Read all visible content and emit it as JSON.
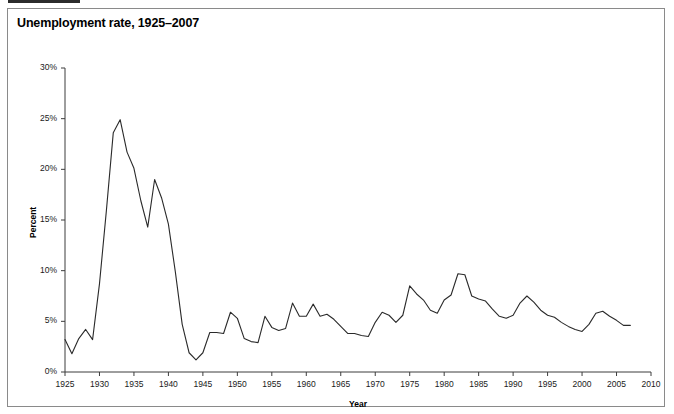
{
  "figure": {
    "title": "Unemployment rate, 1925–2007",
    "frame_border_color": "#8a8a8a",
    "background_color": "#ffffff",
    "line_color": "#2a2a2a"
  },
  "chart_data": {
    "type": "line",
    "title": "Unemployment rate, 1925–2007",
    "xlabel": "Year",
    "ylabel": "Percent",
    "xlim": [
      1925,
      2010
    ],
    "ylim": [
      0,
      30
    ],
    "xticks": [
      1925,
      1930,
      1935,
      1940,
      1945,
      1950,
      1955,
      1960,
      1965,
      1970,
      1975,
      1980,
      1985,
      1990,
      1995,
      2000,
      2005,
      2010
    ],
    "xtick_labels": [
      "1925",
      "1930",
      "1935",
      "1940",
      "1945",
      "1950",
      "1955",
      "1960",
      "1965",
      "1970",
      "1975",
      "1980",
      "1985",
      "1990",
      "1995",
      "2000",
      "2005",
      "2010"
    ],
    "yticks": [
      0,
      5,
      10,
      15,
      20,
      25,
      30
    ],
    "ytick_labels": [
      "0%",
      "5%",
      "10%",
      "15%",
      "20%",
      "25%",
      "30%"
    ],
    "grid": false,
    "legend": "none",
    "series": [
      {
        "name": "Unemployment rate",
        "x": [
          1925,
          1926,
          1927,
          1928,
          1929,
          1930,
          1931,
          1932,
          1933,
          1934,
          1935,
          1936,
          1937,
          1938,
          1939,
          1940,
          1941,
          1942,
          1943,
          1944,
          1945,
          1946,
          1947,
          1948,
          1949,
          1950,
          1951,
          1952,
          1953,
          1954,
          1955,
          1956,
          1957,
          1958,
          1959,
          1960,
          1961,
          1962,
          1963,
          1964,
          1965,
          1966,
          1967,
          1968,
          1969,
          1970,
          1971,
          1972,
          1973,
          1974,
          1975,
          1976,
          1977,
          1978,
          1979,
          1980,
          1981,
          1982,
          1983,
          1984,
          1985,
          1986,
          1987,
          1988,
          1989,
          1990,
          1991,
          1992,
          1993,
          1994,
          1995,
          1996,
          1997,
          1998,
          1999,
          2000,
          2001,
          2002,
          2003,
          2004,
          2005,
          2006,
          2007
        ],
        "y": [
          3.2,
          1.8,
          3.3,
          4.2,
          3.2,
          8.7,
          15.9,
          23.6,
          24.9,
          21.7,
          20.1,
          16.9,
          14.3,
          19.0,
          17.2,
          14.6,
          9.9,
          4.7,
          1.9,
          1.2,
          1.9,
          3.9,
          3.9,
          3.8,
          5.9,
          5.3,
          3.3,
          3.0,
          2.9,
          5.5,
          4.4,
          4.1,
          4.3,
          6.8,
          5.5,
          5.5,
          6.7,
          5.5,
          5.7,
          5.2,
          4.5,
          3.8,
          3.8,
          3.6,
          3.5,
          4.9,
          5.9,
          5.6,
          4.9,
          5.6,
          8.5,
          7.7,
          7.1,
          6.1,
          5.8,
          7.1,
          7.6,
          9.7,
          9.6,
          7.5,
          7.2,
          7.0,
          6.2,
          5.5,
          5.3,
          5.6,
          6.8,
          7.5,
          6.9,
          6.1,
          5.6,
          5.4,
          4.9,
          4.5,
          4.2,
          4.0,
          4.7,
          5.8,
          6.0,
          5.5,
          5.1,
          4.6,
          4.6
        ]
      }
    ]
  }
}
